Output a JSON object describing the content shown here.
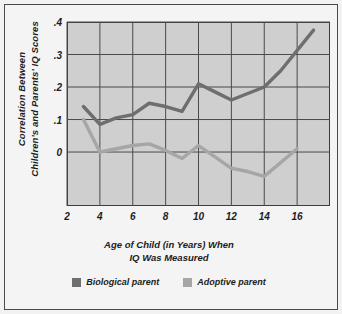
{
  "chart_data": {
    "type": "line",
    "title": "",
    "xlabel": "Age of Child (in Years) When IQ Was Measured",
    "xlabel_line1": "Age of Child (in Years) When",
    "xlabel_line2": "IQ Was Measured",
    "ylabel": "Correlation Between Children's and Parents' IQ Scores",
    "ylabel_line1": "Correlation Between",
    "ylabel_line2": "Children's and Parents' IQ Scores",
    "xlim": [
      2,
      18
    ],
    "ylim": [
      -0.166,
      0.4
    ],
    "xticks": [
      2,
      4,
      6,
      8,
      10,
      12,
      14,
      16
    ],
    "xtick_labels": [
      "2",
      "4",
      "6",
      "8",
      "10",
      "12",
      "14",
      "16"
    ],
    "yticks": [
      0,
      0.1,
      0.2,
      0.3,
      0.4
    ],
    "ytick_labels": [
      "0",
      ".1",
      ".2",
      ".3",
      ".4"
    ],
    "grid": true,
    "legend_position": "below",
    "series": [
      {
        "name": "Biological parent",
        "color": "#6e6e6e",
        "x": [
          3,
          4,
          5,
          6,
          7,
          8,
          9,
          10,
          11,
          12,
          13,
          14,
          15,
          17
        ],
        "values": [
          0.14,
          0.085,
          0.105,
          0.115,
          0.15,
          0.14,
          0.125,
          0.21,
          0.185,
          0.16,
          0.18,
          0.2,
          0.25,
          0.375
        ]
      },
      {
        "name": "Adoptive parent",
        "color": "#a6a6a6",
        "x": [
          3,
          4,
          5,
          6,
          7,
          8,
          9,
          10,
          11,
          12,
          13,
          14,
          16
        ],
        "values": [
          0.1,
          0.0,
          0.01,
          0.02,
          0.025,
          0.005,
          -0.02,
          0.02,
          -0.015,
          -0.05,
          -0.06,
          -0.075,
          0.01
        ]
      }
    ]
  },
  "legend": {
    "items": [
      {
        "label": "Biological parent",
        "color": "#6e6e6e"
      },
      {
        "label": "Adoptive parent",
        "color": "#a6a6a6"
      }
    ]
  }
}
